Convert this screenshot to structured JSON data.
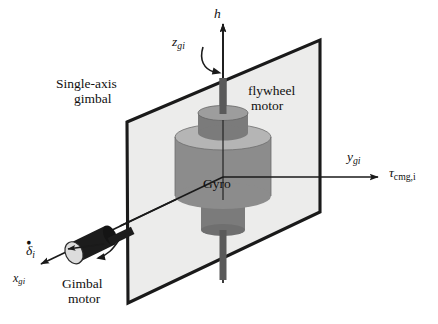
{
  "figure": {
    "type": "technical-diagram",
    "background_color": "#ffffff",
    "colors": {
      "gimbal_plane_fill": "#ececeb",
      "gimbal_plane_edge": "#1a1a1a",
      "flywheel_body": "#8c8c8c",
      "flywheel_top": "#b5b5b5",
      "motor_body": "#7b7b7b",
      "motor_top": "#9d9d9d",
      "shaft": "#5a5a5a",
      "gimbal_motor_body": "#1c1c1c",
      "gimbal_motor_cap": "#dcdcdc",
      "axis_line": "#1a1a1a",
      "text": "#101010"
    },
    "labels": [
      {
        "id": "h",
        "text": "h",
        "style": "italic",
        "x": 214,
        "y": 8
      },
      {
        "id": "z-gi",
        "text": "z",
        "sub": "gi",
        "style": "italic",
        "x": 174,
        "y": 37
      },
      {
        "id": "single-axis-gimbal-line1",
        "text": "Single-axis",
        "style": "roman",
        "x": 58,
        "y": 79
      },
      {
        "id": "single-axis-gimbal-line2",
        "text": "gimbal",
        "style": "roman",
        "x": 75,
        "y": 96
      },
      {
        "id": "flywheel-motor-line1",
        "text": "flywheel",
        "style": "roman",
        "x": 250,
        "y": 86
      },
      {
        "id": "flywheel-motor-line2",
        "text": "motor",
        "style": "roman",
        "x": 252,
        "y": 103
      },
      {
        "id": "y-gi",
        "text": "y",
        "sub": "gi",
        "style": "italic",
        "x": 349,
        "y": 152
      },
      {
        "id": "tau-cmg-i",
        "text": "τ",
        "sub": "cmg,i",
        "style": "italic",
        "x": 391,
        "y": 168
      },
      {
        "id": "gyro",
        "text": "Gyro",
        "style": "roman",
        "x": 205,
        "y": 179
      },
      {
        "id": "delta-dot-i",
        "text": "δ",
        "sub": "i",
        "accent": "dot",
        "style": "italic",
        "x": 27,
        "y": 246
      },
      {
        "id": "x-gi",
        "text": "x",
        "sub": "gi",
        "style": "italic",
        "x": 14,
        "y": 276
      },
      {
        "id": "gimbal-motor-line1",
        "text": "Gimbal",
        "style": "roman",
        "x": 64,
        "y": 279
      },
      {
        "id": "gimbal-motor-line2",
        "text": "motor",
        "style": "roman",
        "x": 70,
        "y": 296
      }
    ],
    "geometry": {
      "gimbal_plane_points": "127,122 320,40 320,212 128,303",
      "z_axis": {
        "x1": 223,
        "y1": 277,
        "x2": 223,
        "y2": 22
      },
      "y_axis": {
        "x1": 223,
        "y1": 177,
        "x2": 375,
        "y2": 177
      },
      "x_axis": {
        "x1": 223,
        "y1": 177,
        "x2": 38,
        "y2": 266
      },
      "flywheel_cx": 223,
      "flywheel_top_y": 137,
      "flywheel_bottom_y": 196,
      "flywheel_rx": 48,
      "flywheel_ry": 13,
      "motor_cx": 223,
      "motor_top_y": 113,
      "motor_bottom_y": 133,
      "motor_rx": 25,
      "motor_ry": 7.5,
      "lower_hub_top_y": 200,
      "lower_hub_bottom_y": 230,
      "lower_hub_rx": 22,
      "lower_hub_ry": 6,
      "gimbal_motor": {
        "cx": 90,
        "cy": 243,
        "length": 44,
        "rx": 10,
        "ry": 16,
        "angle": -26
      }
    }
  }
}
